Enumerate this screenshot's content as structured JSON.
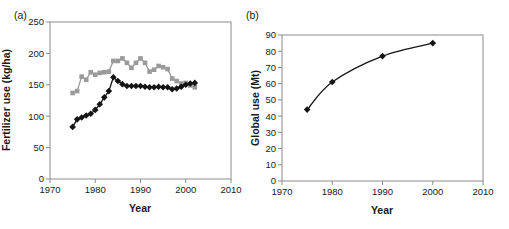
{
  "figure": {
    "background": "#ffffff",
    "panels": [
      {
        "label": "(a)",
        "y_title": "Fertilizer use (kg/ha)",
        "x_title": "Year"
      },
      {
        "label": "(b)",
        "y_title": "Global use (Mt)",
        "x_title": "Year"
      }
    ]
  },
  "colors": {
    "gray_series": "#9a9a9a",
    "black_series": "#141414",
    "plot_border": "#8c8c8c",
    "text": "#1a1a1a"
  },
  "chart_data": [
    {
      "type": "line",
      "title": "",
      "xlabel": "Year",
      "ylabel": "Fertilizer use (kg/ha)",
      "xlim": [
        1970,
        2010
      ],
      "ylim": [
        0,
        250
      ],
      "xticks": [
        1970,
        1980,
        1990,
        2000,
        2010
      ],
      "yticks": [
        0,
        50,
        100,
        150,
        200,
        250
      ],
      "grid": false,
      "legend": "none",
      "x": [
        1975,
        1976,
        1977,
        1978,
        1979,
        1980,
        1981,
        1982,
        1983,
        1984,
        1985,
        1986,
        1987,
        1988,
        1989,
        1990,
        1991,
        1992,
        1993,
        1994,
        1995,
        1996,
        1997,
        1998,
        1999,
        2000,
        2001,
        2002
      ],
      "series": [
        {
          "name": "gray-squares",
          "marker": "square",
          "color": "#9a9a9a",
          "smooth": false,
          "values": [
            137,
            140,
            163,
            158,
            170,
            166,
            169,
            170,
            171,
            188,
            188,
            192,
            185,
            177,
            185,
            192,
            185,
            171,
            174,
            180,
            178,
            175,
            160,
            156,
            152,
            153,
            149,
            146
          ]
        },
        {
          "name": "black-diamonds",
          "marker": "diamond",
          "color": "#141414",
          "smooth": false,
          "values": [
            83,
            95,
            98,
            101,
            104,
            110,
            119,
            130,
            140,
            162,
            156,
            151,
            148,
            148,
            148,
            148,
            147,
            146,
            146,
            147,
            146,
            146,
            143,
            144,
            147,
            150,
            152,
            153
          ]
        }
      ]
    },
    {
      "type": "line",
      "title": "",
      "xlabel": "Year",
      "ylabel": "Global use (Mt)",
      "xlim": [
        1970,
        2010
      ],
      "ylim": [
        0,
        90
      ],
      "xticks": [
        1970,
        1980,
        1990,
        2000,
        2010
      ],
      "yticks": [
        0,
        10,
        20,
        30,
        40,
        50,
        60,
        70,
        80,
        90
      ],
      "grid": false,
      "legend": "none",
      "x": [
        1975,
        1980,
        1990,
        2000
      ],
      "series": [
        {
          "name": "black-diamonds",
          "marker": "diamond",
          "color": "#141414",
          "smooth": true,
          "values": [
            44,
            61,
            77,
            85
          ]
        }
      ]
    }
  ]
}
